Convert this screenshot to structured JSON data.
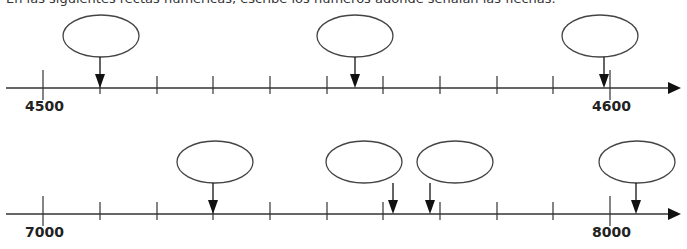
{
  "instruction": "En las siguientes rectas numéricas, escribe los números adonde señalan las flechas.",
  "colors": {
    "line": "#333333",
    "arrow": "#111111",
    "oval_stroke": "#444444",
    "label": "#222222"
  },
  "number_lines": [
    {
      "id": "line-1",
      "y": 88,
      "start_label": "4500",
      "end_label": "4600",
      "start_value": 4500,
      "end_value": 4600,
      "tick_step": 10,
      "tick_x": [
        43,
        100,
        157,
        213,
        270,
        327,
        383,
        440,
        497,
        553,
        610
      ],
      "pointers": [
        {
          "x": 100,
          "oval_cx": 101,
          "oval_cy": 36,
          "answer_box": ""
        },
        {
          "x": 355,
          "oval_cx": 355,
          "oval_cy": 36,
          "answer_box": ""
        },
        {
          "x": 604,
          "oval_cx": 600,
          "oval_cy": 36,
          "answer_box": ""
        }
      ]
    },
    {
      "id": "line-2",
      "y": 214,
      "start_label": "7000",
      "end_label": "8000",
      "start_value": 7000,
      "end_value": 8000,
      "tick_step": 100,
      "tick_x": [
        43,
        100,
        157,
        213,
        270,
        327,
        383,
        440,
        497,
        553,
        610
      ],
      "pointers": [
        {
          "x": 213,
          "oval_cx": 215,
          "oval_cy": 162,
          "answer_box": ""
        },
        {
          "x": 393,
          "oval_cx": 364,
          "oval_cy": 162,
          "answer_box": ""
        },
        {
          "x": 430,
          "oval_cx": 455,
          "oval_cy": 162,
          "answer_box": ""
        },
        {
          "x": 636,
          "oval_cx": 637,
          "oval_cy": 162,
          "answer_box": ""
        }
      ]
    }
  ]
}
